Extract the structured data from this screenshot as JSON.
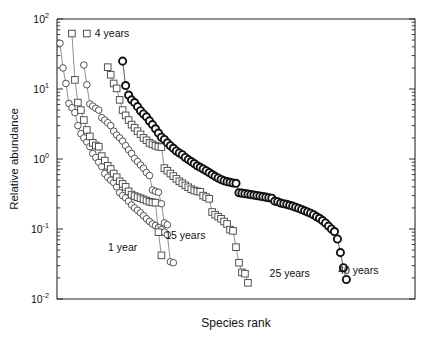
{
  "chart_data": {
    "type": "scatter",
    "title": "",
    "subtitle": "",
    "xlabel": "Species rank",
    "ylabel": "Relative abundance",
    "xlim": [
      0,
      120
    ],
    "ylim": [
      0.01,
      100
    ],
    "yscale": "log",
    "xscale": "linear",
    "grid": false,
    "legend_position": "inline-annotations",
    "x_ticks_shown": false,
    "y_tick_labels": [
      "10²",
      "10¹",
      "10⁰",
      "10⁻¹",
      "10⁻²"
    ],
    "y_tick_values": [
      100,
      10,
      1,
      0.1,
      0.01
    ],
    "y_minor_ticks": true,
    "annotations": [
      {
        "text": "4 years",
        "x": 10,
        "y": 62,
        "marker": "square"
      },
      {
        "text": "1 year",
        "x": 22,
        "y": 0.055,
        "marker": "none"
      },
      {
        "text": "15 years",
        "x": 43,
        "y": 0.082,
        "marker": "none"
      },
      {
        "text": "25 years",
        "x": 78,
        "y": 0.023,
        "marker": "none"
      },
      {
        "text": "40 years",
        "x": 101,
        "y": 0.026,
        "marker": "none"
      }
    ],
    "series": [
      {
        "name": "1 year",
        "marker": "circle",
        "marker_style": "open",
        "color": "#4a4a4a",
        "points": [
          [
            1,
            45.0
          ],
          [
            2,
            20.0
          ],
          [
            3,
            12.0
          ],
          [
            4,
            6.2
          ],
          [
            5,
            5.4
          ],
          [
            6,
            4.6
          ],
          [
            7,
            3.0
          ],
          [
            8,
            2.3
          ],
          [
            9,
            2.0
          ],
          [
            10,
            1.75
          ],
          [
            11,
            1.5
          ],
          [
            12,
            1.2
          ],
          [
            13,
            1.05
          ],
          [
            14,
            0.9
          ],
          [
            15,
            0.78
          ],
          [
            16,
            0.62
          ],
          [
            17,
            0.55
          ],
          [
            18,
            0.5
          ],
          [
            19,
            0.46
          ],
          [
            20,
            0.4
          ],
          [
            21,
            0.33
          ],
          [
            22,
            0.3
          ],
          [
            23,
            0.28
          ],
          [
            24,
            0.25
          ],
          [
            25,
            0.22
          ],
          [
            26,
            0.2
          ],
          [
            27,
            0.185
          ],
          [
            28,
            0.17
          ],
          [
            29,
            0.155
          ],
          [
            30,
            0.14
          ],
          [
            31,
            0.128
          ],
          [
            32,
            0.118
          ],
          [
            33,
            0.112
          ],
          [
            34,
            0.105
          ],
          [
            35,
            0.098
          ],
          [
            36,
            0.09
          ],
          [
            37,
            0.083
          ],
          [
            38,
            0.034
          ],
          [
            39,
            0.033
          ]
        ]
      },
      {
        "name": "4 years",
        "marker": "square",
        "marker_style": "open",
        "color": "#4a4a4a",
        "points": [
          [
            5,
            62.0
          ],
          [
            6,
            13.5
          ],
          [
            7,
            6.4
          ],
          [
            8,
            5.0
          ],
          [
            9,
            3.6
          ],
          [
            10,
            2.6
          ],
          [
            11,
            2.1
          ],
          [
            12,
            1.7
          ],
          [
            13,
            1.56
          ],
          [
            14,
            1.5
          ],
          [
            15,
            1.1
          ],
          [
            16,
            0.95
          ],
          [
            17,
            0.8
          ],
          [
            18,
            0.72
          ],
          [
            19,
            0.62
          ],
          [
            20,
            0.55
          ],
          [
            21,
            0.48
          ],
          [
            22,
            0.44
          ],
          [
            23,
            0.4
          ],
          [
            24,
            0.345
          ],
          [
            25,
            0.31
          ],
          [
            26,
            0.295
          ],
          [
            27,
            0.285
          ],
          [
            28,
            0.275
          ],
          [
            29,
            0.265
          ],
          [
            30,
            0.255
          ],
          [
            31,
            0.245
          ],
          [
            32,
            0.24
          ],
          [
            33,
            0.238
          ],
          [
            34,
            0.09
          ],
          [
            35,
            0.042
          ]
        ]
      },
      {
        "name": "15 years",
        "marker": "circle",
        "marker_style": "open",
        "color": "#4a4a4a",
        "points": [
          [
            9,
            22.0
          ],
          [
            10,
            11.5
          ],
          [
            11,
            6.1
          ],
          [
            12,
            5.7
          ],
          [
            13,
            5.3
          ],
          [
            14,
            5.0
          ],
          [
            15,
            3.9
          ],
          [
            16,
            3.6
          ],
          [
            17,
            3.3
          ],
          [
            18,
            3.0
          ],
          [
            19,
            2.5
          ],
          [
            20,
            2.2
          ],
          [
            21,
            2.0
          ],
          [
            22,
            1.8
          ],
          [
            23,
            1.55
          ],
          [
            24,
            1.35
          ],
          [
            25,
            1.2
          ],
          [
            26,
            1.02
          ],
          [
            27,
            0.92
          ],
          [
            28,
            0.82
          ],
          [
            29,
            0.74
          ],
          [
            30,
            0.64
          ],
          [
            31,
            0.58
          ],
          [
            32,
            0.36
          ],
          [
            33,
            0.345
          ],
          [
            34,
            0.335
          ],
          [
            35,
            0.23
          ],
          [
            36,
            0.122
          ],
          [
            37,
            0.115
          ]
        ]
      },
      {
        "name": "25 years",
        "marker": "square",
        "marker_style": "open",
        "color": "#4a4a4a",
        "points": [
          [
            17,
            20.5
          ],
          [
            18,
            16.0
          ],
          [
            19,
            12.0
          ],
          [
            20,
            10.2
          ],
          [
            21,
            7.0
          ],
          [
            22,
            5.0
          ],
          [
            23,
            4.2
          ],
          [
            24,
            3.6
          ],
          [
            25,
            3.1
          ],
          [
            26,
            2.8
          ],
          [
            27,
            2.5
          ],
          [
            28,
            2.25
          ],
          [
            29,
            2.0
          ],
          [
            30,
            1.85
          ],
          [
            31,
            1.7
          ],
          [
            32,
            1.62
          ],
          [
            33,
            1.55
          ],
          [
            34,
            1.5
          ],
          [
            35,
            1.48
          ],
          [
            36,
            0.74
          ],
          [
            37,
            0.68
          ],
          [
            38,
            0.62
          ],
          [
            39,
            0.57
          ],
          [
            40,
            0.52
          ],
          [
            41,
            0.48
          ],
          [
            42,
            0.45
          ],
          [
            43,
            0.42
          ],
          [
            44,
            0.395
          ],
          [
            45,
            0.37
          ],
          [
            46,
            0.355
          ],
          [
            47,
            0.345
          ],
          [
            48,
            0.34
          ],
          [
            49,
            0.3
          ],
          [
            50,
            0.285
          ],
          [
            51,
            0.27
          ],
          [
            52,
            0.175
          ],
          [
            53,
            0.16
          ],
          [
            54,
            0.15
          ],
          [
            55,
            0.14
          ],
          [
            56,
            0.128
          ],
          [
            57,
            0.118
          ],
          [
            58,
            0.098
          ],
          [
            59,
            0.094
          ],
          [
            60,
            0.055
          ],
          [
            61,
            0.033
          ],
          [
            62,
            0.024
          ],
          [
            63,
            0.023
          ],
          [
            64,
            0.017
          ]
        ]
      },
      {
        "name": "40 years",
        "marker": "circle",
        "marker_style": "open-bold",
        "color": "#111111",
        "points": [
          [
            22,
            25.0
          ],
          [
            23,
            11.2
          ],
          [
            24,
            8.2
          ],
          [
            25,
            7.0
          ],
          [
            26,
            6.4
          ],
          [
            27,
            5.6
          ],
          [
            28,
            4.9
          ],
          [
            29,
            4.4
          ],
          [
            30,
            4.0
          ],
          [
            31,
            3.5
          ],
          [
            32,
            3.1
          ],
          [
            33,
            2.7
          ],
          [
            34,
            2.35
          ],
          [
            35,
            2.05
          ],
          [
            36,
            1.9
          ],
          [
            37,
            1.7
          ],
          [
            38,
            1.55
          ],
          [
            39,
            1.42
          ],
          [
            40,
            1.3
          ],
          [
            41,
            1.22
          ],
          [
            42,
            1.15
          ],
          [
            43,
            1.05
          ],
          [
            44,
            0.98
          ],
          [
            45,
            0.92
          ],
          [
            46,
            0.86
          ],
          [
            47,
            0.8
          ],
          [
            48,
            0.76
          ],
          [
            49,
            0.72
          ],
          [
            50,
            0.68
          ],
          [
            51,
            0.64
          ],
          [
            52,
            0.6
          ],
          [
            53,
            0.565
          ],
          [
            54,
            0.535
          ],
          [
            55,
            0.51
          ],
          [
            56,
            0.49
          ],
          [
            57,
            0.475
          ],
          [
            58,
            0.465
          ],
          [
            59,
            0.455
          ],
          [
            60,
            0.45
          ],
          [
            61,
            0.33
          ],
          [
            62,
            0.325
          ],
          [
            63,
            0.32
          ],
          [
            64,
            0.315
          ],
          [
            65,
            0.31
          ],
          [
            66,
            0.305
          ],
          [
            67,
            0.3
          ],
          [
            68,
            0.295
          ],
          [
            69,
            0.29
          ],
          [
            70,
            0.285
          ],
          [
            71,
            0.28
          ],
          [
            72,
            0.275
          ],
          [
            73,
            0.25
          ],
          [
            74,
            0.245
          ],
          [
            75,
            0.235
          ],
          [
            76,
            0.23
          ],
          [
            77,
            0.225
          ],
          [
            78,
            0.218
          ],
          [
            79,
            0.212
          ],
          [
            80,
            0.205
          ],
          [
            81,
            0.198
          ],
          [
            82,
            0.19
          ],
          [
            83,
            0.182
          ],
          [
            84,
            0.175
          ],
          [
            85,
            0.168
          ],
          [
            86,
            0.16
          ],
          [
            87,
            0.15
          ],
          [
            88,
            0.142
          ],
          [
            89,
            0.132
          ],
          [
            90,
            0.122
          ],
          [
            91,
            0.11
          ],
          [
            92,
            0.1
          ],
          [
            93,
            0.092
          ],
          [
            94,
            0.072
          ],
          [
            95,
            0.046
          ],
          [
            96,
            0.028
          ],
          [
            97,
            0.019
          ]
        ]
      }
    ]
  },
  "plot": {
    "left_px": 57,
    "right_px": 415,
    "top_px": 19,
    "bottom_px": 299
  }
}
